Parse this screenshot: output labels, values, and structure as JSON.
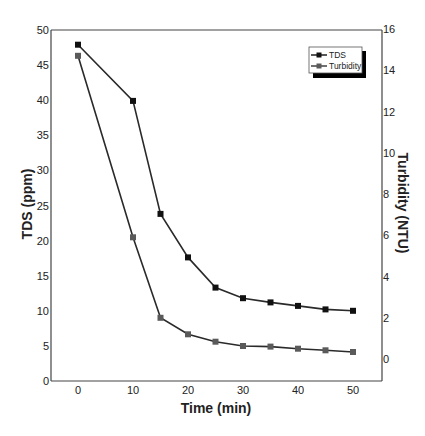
{
  "chart_data": {
    "type": "line",
    "title": "",
    "xlabel": "Time (min)",
    "ylabel": "TDS (ppm)",
    "ylabel_right": "Turbidity (NTU)",
    "x": [
      0,
      10,
      15,
      20,
      25,
      30,
      35,
      40,
      45,
      50
    ],
    "xlim": [
      -5,
      55
    ],
    "ylim": [
      0,
      50
    ],
    "ylim_right": [
      -1.07,
      16
    ],
    "x_ticks": [
      0,
      10,
      20,
      30,
      40,
      50
    ],
    "y_ticks": [
      0,
      5,
      10,
      15,
      20,
      25,
      30,
      35,
      40,
      45,
      50
    ],
    "y_ticks_right": [
      0,
      2,
      4,
      6,
      8,
      10,
      12,
      14,
      16
    ],
    "grid": false,
    "legend_position": "upper right",
    "series": [
      {
        "name": "TDS",
        "axis": "left",
        "color": "#111111",
        "marker": "square",
        "values": [
          47.9,
          39.9,
          23.8,
          17.6,
          13.3,
          11.8,
          11.2,
          10.7,
          10.2,
          10.0
        ]
      },
      {
        "name": "Turbidity",
        "axis": "right",
        "color": "#5a5a5a",
        "marker": "square",
        "values": [
          14.7,
          5.9,
          2.0,
          1.2,
          0.84,
          0.63,
          0.6,
          0.5,
          0.42,
          0.34
        ]
      }
    ]
  },
  "legend": {
    "items": [
      {
        "label": "TDS",
        "color": "#111111"
      },
      {
        "label": "Turbidity",
        "color": "#5a5a5a"
      }
    ]
  },
  "style": {
    "axis_color": "#444444",
    "line_color": "#2a2a2a"
  }
}
